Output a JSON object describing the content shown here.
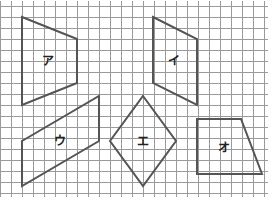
{
  "diagram": {
    "type": "grid-shapes",
    "grid": {
      "x0": 0,
      "y0": 6,
      "spacing": 11,
      "cols": 24,
      "rows": 17,
      "color": "#9a9a9a"
    },
    "stroke_color": "#555555",
    "shapes": [
      {
        "id": "a",
        "label": "ア",
        "points": "22,17 77,39 77,83 22,105",
        "label_x": 48,
        "label_y": 61
      },
      {
        "id": "i",
        "label": "イ",
        "points": "153,17 197,39 197,105 153,83",
        "label_x": 174,
        "label_y": 61
      },
      {
        "id": "u",
        "label": "ウ",
        "points": "22,141 99,96 99,141 22,186",
        "label_x": 60,
        "label_y": 141
      },
      {
        "id": "e",
        "label": "エ",
        "points": "143,96 176,141 143,186 110,141",
        "label_x": 143,
        "label_y": 142
      },
      {
        "id": "o",
        "label": "オ",
        "points": "197,119 241,119 262,174 197,174",
        "label_x": 224,
        "label_y": 148
      }
    ]
  }
}
